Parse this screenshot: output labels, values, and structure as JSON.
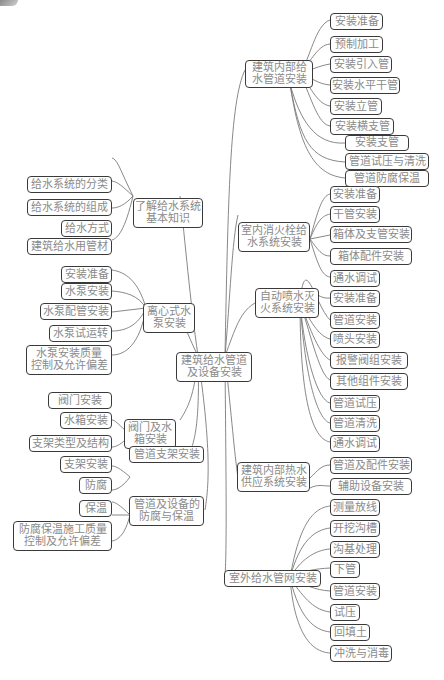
{
  "root": {
    "label_line1": "建筑给水管道",
    "label_line2": "及设备安装"
  },
  "right_branches": [
    {
      "id": "b1",
      "label_line1": "建筑内部给",
      "label_line2": "水管道安装",
      "children": [
        "安装准备",
        "预制加工",
        "安装引入管",
        "安装水平干管",
        "安装立管",
        "安装横支管",
        "安装支管",
        "管道试压与清洗",
        "管道防腐保温"
      ]
    },
    {
      "id": "b2",
      "label_line1": "室内消火栓给",
      "label_line2": "水系统安装",
      "children": [
        "安装准备",
        "干管安装",
        "箱体及支管安装",
        "箱体配件安装",
        "通水调试"
      ]
    },
    {
      "id": "b3",
      "label_line1": "自动喷水灭",
      "label_line2": "火系统安装",
      "children": [
        "安装准备",
        "管道安装",
        "喷头安装",
        "报警阀组安装",
        "其他组件安装",
        "管道试压",
        "管道清洗",
        "通水调试"
      ]
    },
    {
      "id": "b4",
      "label_line1": "建筑内部热水",
      "label_line2": "供应系统安装",
      "children": [
        "管道及配件安装",
        "辅助设备安装"
      ]
    },
    {
      "id": "b5",
      "label_line1": "室外给水管网安装",
      "label_line2": "",
      "children": [
        "测量放线",
        "开挖沟槽",
        "沟基处理",
        "下管",
        "管道安装",
        "试压",
        "回填土",
        "冲洗与消毒"
      ]
    }
  ],
  "left_branches": [
    {
      "id": "l1",
      "label_line1": "了解给水系统",
      "label_line2": "基本知识",
      "children": [
        [
          "给水系统的分类"
        ],
        [
          "给水系统的组成"
        ],
        [
          "给水方式"
        ],
        [
          "建筑给水用管材"
        ]
      ]
    },
    {
      "id": "l2",
      "label_line1": "离心式水",
      "label_line2": "泵安装",
      "children": [
        [
          "安装准备"
        ],
        [
          "水泵安装"
        ],
        [
          "水泵配管安装"
        ],
        [
          "水泵试运转"
        ],
        [
          "水泵安装质量",
          "控制及允许偏差"
        ]
      ]
    },
    {
      "id": "l3",
      "label_line1": "阀门及水",
      "label_line2": "箱安装",
      "children": [
        [
          "阀门安装"
        ],
        [
          "水箱安装"
        ]
      ]
    },
    {
      "id": "l4",
      "label_line1": "管道支架安装",
      "label_line2": "",
      "children": [
        [
          "支架类型及结构"
        ],
        [
          "支架安装"
        ]
      ]
    },
    {
      "id": "l5",
      "label_line1": "管道及设备的",
      "label_line2": "防腐与保温",
      "children": [
        [
          "防腐"
        ],
        [
          "保温"
        ],
        [
          "防腐保温施工质量",
          "控制及允许偏差"
        ]
      ]
    }
  ],
  "colors": {
    "border": "#3a3a3a",
    "text": "#8a8a8a",
    "link": "#7a7a7a",
    "background": "#ffffff"
  }
}
